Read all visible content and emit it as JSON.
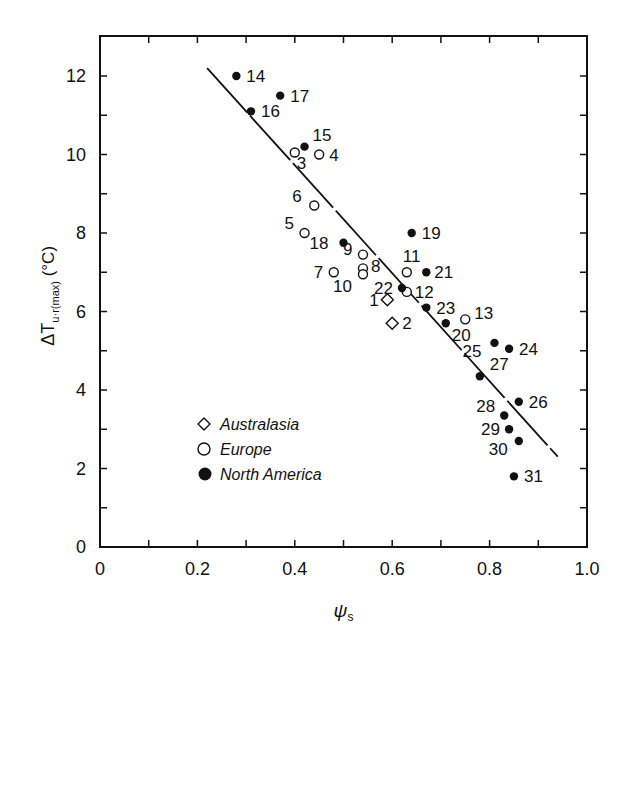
{
  "chart_data": {
    "type": "scatter",
    "title": "",
    "xlabel": "ψs",
    "ylabel": "ΔTu·r(max) (°C)",
    "xlim": [
      0,
      1.0
    ],
    "ylim": [
      0,
      13.2
    ],
    "x_ticks": [
      0,
      0.2,
      0.4,
      0.6,
      0.8,
      1.0
    ],
    "x_tick_labels": [
      "0",
      "0.2",
      "0.4",
      "0.6",
      "0.8",
      "1.0"
    ],
    "y_ticks": [
      0,
      2,
      4,
      6,
      8,
      10,
      12
    ],
    "y_tick_labels": [
      "0",
      "2",
      "4",
      "6",
      "8",
      "10",
      "12"
    ],
    "grid": false,
    "legend_position": "lower-left inside",
    "legend": [
      {
        "name": "Australasia",
        "marker": "open-diamond"
      },
      {
        "name": "Europe",
        "marker": "open-circle"
      },
      {
        "name": "North America",
        "marker": "filled-circle"
      }
    ],
    "series": [
      {
        "name": "Australasia",
        "marker": "open-diamond",
        "points": [
          {
            "id": "1",
            "x": 0.59,
            "y": 6.3
          },
          {
            "id": "2",
            "x": 0.6,
            "y": 5.7
          }
        ]
      },
      {
        "name": "Europe",
        "marker": "open-circle",
        "points": [
          {
            "id": "3",
            "x": 0.4,
            "y": 10.05
          },
          {
            "id": "4",
            "x": 0.45,
            "y": 10.0
          },
          {
            "id": "5",
            "x": 0.42,
            "y": 8.0
          },
          {
            "id": "6",
            "x": 0.44,
            "y": 8.7
          },
          {
            "id": "7",
            "x": 0.48,
            "y": 7.0
          },
          {
            "id": "8",
            "x": 0.54,
            "y": 7.1
          },
          {
            "id": "9",
            "x": 0.54,
            "y": 7.45
          },
          {
            "id": "10",
            "x": 0.54,
            "y": 6.95
          },
          {
            "id": "11",
            "x": 0.63,
            "y": 7.0
          },
          {
            "id": "12",
            "x": 0.63,
            "y": 6.5
          },
          {
            "id": "13",
            "x": 0.75,
            "y": 5.8
          }
        ]
      },
      {
        "name": "North America",
        "marker": "filled-circle",
        "points": [
          {
            "id": "14",
            "x": 0.28,
            "y": 12.0
          },
          {
            "id": "15",
            "x": 0.42,
            "y": 10.2
          },
          {
            "id": "16",
            "x": 0.31,
            "y": 11.1
          },
          {
            "id": "17",
            "x": 0.37,
            "y": 11.5
          },
          {
            "id": "18",
            "x": 0.5,
            "y": 7.75
          },
          {
            "id": "19",
            "x": 0.64,
            "y": 8.0
          },
          {
            "id": "20",
            "x": 0.71,
            "y": 5.7
          },
          {
            "id": "21",
            "x": 0.67,
            "y": 7.0
          },
          {
            "id": "22",
            "x": 0.62,
            "y": 6.6
          },
          {
            "id": "23",
            "x": 0.67,
            "y": 6.1
          },
          {
            "id": "24",
            "x": 0.84,
            "y": 5.05
          },
          {
            "id": "25",
            "x": 0.81,
            "y": 5.2
          },
          {
            "id": "26",
            "x": 0.86,
            "y": 3.7
          },
          {
            "id": "27",
            "x": 0.78,
            "y": 4.35
          },
          {
            "id": "28",
            "x": 0.83,
            "y": 3.35
          },
          {
            "id": "29",
            "x": 0.84,
            "y": 3.0
          },
          {
            "id": "30",
            "x": 0.86,
            "y": 2.7
          },
          {
            "id": "31",
            "x": 0.85,
            "y": 1.8
          }
        ]
      }
    ],
    "regression_line": {
      "x1": 0.22,
      "y1": 12.2,
      "x2": 0.94,
      "y2": 2.3,
      "style": "solid (with small gaps)"
    }
  }
}
